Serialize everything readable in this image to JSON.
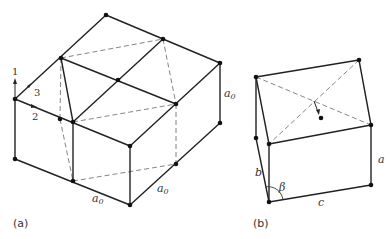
{
  "figure": {
    "panel_a": {
      "label": "(a)",
      "axes": {
        "axis_1": "1",
        "axis_2": "2",
        "axis_3": "3"
      },
      "dimension_labels": {
        "vertical": "a",
        "front_left": "a",
        "front_right": "a",
        "subscript": "0"
      }
    },
    "panel_b": {
      "label": "(b)",
      "lattice_params": {
        "a": "a",
        "b": "b",
        "c": "c",
        "beta": "β"
      }
    }
  }
}
